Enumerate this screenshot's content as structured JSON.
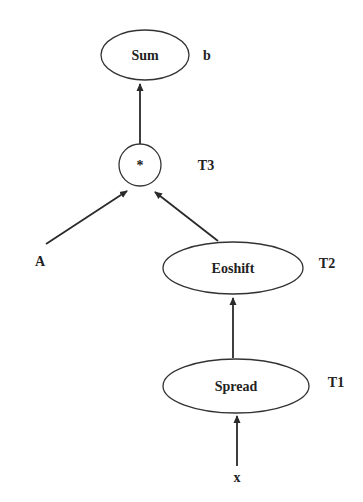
{
  "nodes": {
    "sum": {
      "label": "Sum",
      "annotation": "b"
    },
    "mult": {
      "label": "*",
      "annotation": "T3"
    },
    "eoshift": {
      "label": "Eoshift",
      "annotation": "T2"
    },
    "spread": {
      "label": "Spread",
      "annotation": "T1"
    }
  },
  "inputs": {
    "a": {
      "label": "A"
    },
    "x": {
      "label": "x"
    }
  },
  "edges": [
    {
      "from": "x",
      "to": "spread"
    },
    {
      "from": "spread",
      "to": "eoshift"
    },
    {
      "from": "eoshift",
      "to": "mult"
    },
    {
      "from": "a",
      "to": "mult"
    },
    {
      "from": "mult",
      "to": "sum"
    }
  ],
  "colors": {
    "stroke": "#333333",
    "text": "#222222",
    "background": "#ffffff"
  }
}
